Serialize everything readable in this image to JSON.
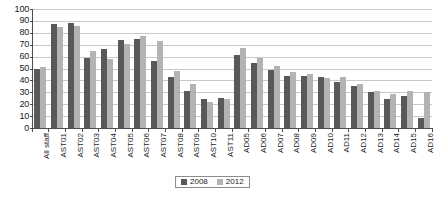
{
  "chart_data": {
    "type": "bar",
    "title": "",
    "xlabel": "",
    "ylabel": "",
    "ylim": [
      0,
      100
    ],
    "ytick_step": 10,
    "yticks": [
      100,
      90,
      80,
      70,
      60,
      50,
      40,
      30,
      20,
      10,
      0
    ],
    "grid": true,
    "legend_position": "bottom-center",
    "categories": [
      "All staff",
      "AST01",
      "AST02",
      "AST03",
      "AST04",
      "AST05",
      "AST06",
      "AST07",
      "AST08",
      "AST09",
      "AST10",
      "AST11",
      "AD05",
      "AD06",
      "AD07",
      "AD08",
      "AD09",
      "AD10",
      "AD11",
      "AD12",
      "AD13",
      "AD14",
      "AD15",
      "AD16"
    ],
    "series": [
      {
        "name": "2008",
        "color": "#595959",
        "values": [
          50,
          87,
          88,
          59,
          66,
          74,
          75,
          56,
          43,
          31,
          24,
          25,
          61,
          55,
          49,
          44,
          44,
          43,
          39,
          35,
          30,
          24,
          27,
          8
        ]
      },
      {
        "name": "2012",
        "color": "#b3b3b3",
        "values": [
          51,
          85,
          86,
          65,
          58,
          71,
          77,
          73,
          48,
          37,
          22,
          24,
          67,
          59,
          52,
          47,
          45,
          42,
          43,
          37,
          31,
          29,
          31,
          30
        ]
      }
    ]
  },
  "legend": {
    "items": [
      {
        "label": "2008",
        "color": "#595959"
      },
      {
        "label": "2012",
        "color": "#b3b3b3"
      }
    ]
  },
  "colors": {
    "series_2008": "#595959",
    "series_2012": "#b3b3b3",
    "axis": "#4d4d4d",
    "gridline": "#c9c9c9",
    "text": "#1a1a1a",
    "background": "#ffffff"
  }
}
